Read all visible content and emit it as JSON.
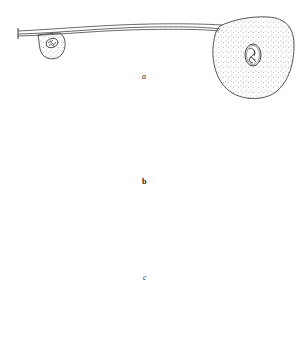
{
  "figure": {
    "background": "#ffffff",
    "ink_color": "#2a2a2a",
    "stipple_color": "#555555",
    "panels": [
      {
        "id": "a",
        "label": "a",
        "description": "Long double-walled tube with small stippled bulge containing one nucleus at left and a large rounded stippled cell body containing one nucleus at right end"
      },
      {
        "id": "b",
        "label": "b",
        "description": "Tube curving downward into a tapering tail; two connected stippled lobes each containing one nucleus, with a small triangular vacuole near the upper nucleus"
      },
      {
        "id": "c",
        "label": "c",
        "description": "Thin tube with rounded open end at left, terminating in a pear-shaped double-walled stippled cell containing two nuclei"
      }
    ]
  }
}
